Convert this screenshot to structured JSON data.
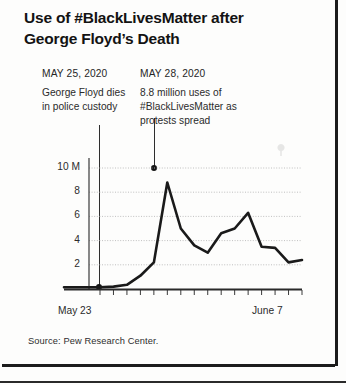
{
  "title": "Use of #BlackLivesMatter after George Floyd’s Death",
  "annotations": [
    {
      "date": "MAY 25, 2020",
      "body": "George Floyd dies in police custody"
    },
    {
      "date": "MAY 28, 2020",
      "body": "8.8 million uses of #BlackLivesMatter as protests spread"
    }
  ],
  "source": "Source: Pew Research Center.",
  "colors": {
    "line": "#1a1a1a",
    "axis": "#3a3a3a",
    "gridline": "#b9b9b9",
    "text": "#262626",
    "background": "#fdfdfc"
  },
  "chart_data": {
    "type": "line",
    "title": "Use of #BlackLivesMatter after George Floyd’s Death",
    "subtitle": "",
    "xlabel": "",
    "ylabel": "",
    "x": [
      "May 23",
      "May 24",
      "May 25",
      "May 26",
      "May 27",
      "May 28",
      "May 29",
      "May 30",
      "May 31",
      "June 1",
      "June 2",
      "June 3",
      "June 4",
      "June 5",
      "June 6",
      "June 7"
    ],
    "values": [
      0.15,
      0.2,
      0.35,
      1.1,
      2.2,
      8.8,
      5.0,
      3.6,
      3.0,
      4.6,
      5.0,
      6.3,
      3.5,
      3.4,
      2.2,
      2.4
    ],
    "units": "millions of uses",
    "ylim": [
      0,
      11
    ],
    "yticks": [
      2,
      4,
      6,
      8,
      10
    ],
    "ytick_labels": [
      "2",
      "4",
      "6",
      "8",
      "10 M"
    ],
    "xtick_labels": [
      "May 23",
      "June 7"
    ],
    "grid": true,
    "legend": false,
    "annotated_points": [
      {
        "label": "MAY 25, 2020",
        "x": "May 25",
        "y": 0.35
      },
      {
        "label": "MAY 28, 2020",
        "x": "May 28",
        "y": 8.8
      }
    ]
  }
}
